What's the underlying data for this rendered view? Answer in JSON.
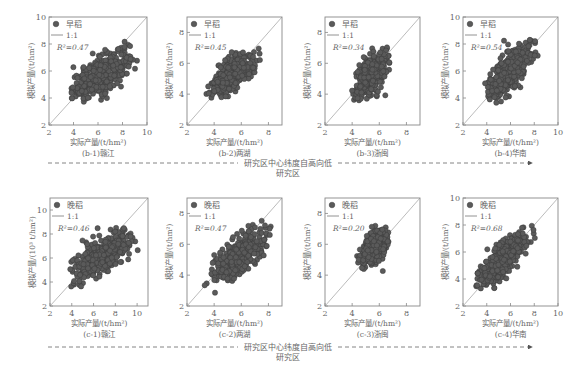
{
  "figure": {
    "arrow_label": "研究区中心纬度自高向低",
    "arrow_sublabel": "研究区",
    "xlabel": "实际产量/(t/hm²)",
    "legend_point": "",
    "legend_line": "1:1",
    "colors": {
      "point": "#5a5a5a",
      "point_edge": "#3a3a3a",
      "frame": "#888888",
      "identity": "#aaaaaa",
      "text": "#666666"
    }
  },
  "chart_data": [
    {
      "id": "b-1",
      "type": "scatter",
      "caption": "(b-1)赣江",
      "series": "早稻",
      "r2": "R²=0.47",
      "xlabel": "实际产量/(t/hm²)",
      "ylabel": "模拟产量/(t/hm²)",
      "xlim": [
        2,
        10
      ],
      "ylim": [
        2,
        10
      ],
      "xticks": [
        2,
        4,
        6,
        8,
        10
      ],
      "yticks": [
        2,
        4,
        6,
        8,
        10
      ],
      "x_range": [
        3.8,
        9.3
      ],
      "y_range": [
        2.9,
        8.8
      ],
      "center": [
        6.2,
        5.7
      ],
      "spread": [
        1.15,
        0.9
      ],
      "corr": 0.69
    },
    {
      "id": "b-2",
      "type": "scatter",
      "caption": "(b-2)两湖",
      "series": "早稻",
      "r2": "R²=0.45",
      "xlabel": "实际产量/(t/hm²)",
      "ylabel": "模拟产量/(t/hm²)",
      "xlim": [
        2,
        9
      ],
      "ylim": [
        2,
        9
      ],
      "xticks": [
        2,
        4,
        6,
        8
      ],
      "yticks": [
        2,
        4,
        6,
        8
      ],
      "x_range": [
        3.3,
        7.5
      ],
      "y_range": [
        3.7,
        7.2
      ],
      "center": [
        5.3,
        5.3
      ],
      "spread": [
        0.75,
        0.65
      ],
      "corr": 0.67
    },
    {
      "id": "b-3",
      "type": "scatter",
      "caption": "(b-3)浙闽",
      "series": "早稻",
      "r2": "R²=0.34",
      "xlabel": "实际产量/(t/hm²)",
      "ylabel": "模拟产量/(t/hm²)",
      "xlim": [
        2,
        9
      ],
      "ylim": [
        2,
        9
      ],
      "xticks": [
        2,
        4,
        6,
        8
      ],
      "yticks": [
        2,
        4,
        6,
        8
      ],
      "x_range": [
        3.9,
        6.8
      ],
      "y_range": [
        3.5,
        7.1
      ],
      "center": [
        5.4,
        5.3
      ],
      "spread": [
        0.6,
        0.75
      ],
      "corr": 0.58
    },
    {
      "id": "b-4",
      "type": "scatter",
      "caption": "(b-4)华南",
      "series": "早稻",
      "r2": "R²=0.54",
      "xlabel": "实际产量/(t/hm²)",
      "ylabel": "模拟产量/(t/hm²)",
      "xlim": [
        2,
        10
      ],
      "ylim": [
        2,
        10
      ],
      "xticks": [
        2,
        4,
        6,
        8,
        10
      ],
      "yticks": [
        2,
        4,
        6,
        8,
        10
      ],
      "x_range": [
        3.8,
        8.3
      ],
      "y_range": [
        3.6,
        8.7
      ],
      "center": [
        5.8,
        5.8
      ],
      "spread": [
        0.95,
        1.05
      ],
      "corr": 0.73
    },
    {
      "id": "c-1",
      "type": "scatter",
      "caption": "(c-1)赣江",
      "series": "晚稻",
      "r2": "R²=0.46",
      "xlabel": "实际产量/(t/hm²)",
      "ylabel": "模拟产量/(10³ t/hm²)",
      "xlim": [
        2,
        11
      ],
      "ylim": [
        2,
        11
      ],
      "xticks": [
        2,
        4,
        6,
        8,
        10
      ],
      "yticks": [
        2,
        4,
        6,
        8,
        10
      ],
      "x_range": [
        3.7,
        10.1
      ],
      "y_range": [
        3.4,
        9.3
      ],
      "center": [
        6.8,
        6.2
      ],
      "spread": [
        1.3,
        1.0
      ],
      "corr": 0.68
    },
    {
      "id": "c-2",
      "type": "scatter",
      "caption": "(c-2)两湖",
      "series": "晚稻",
      "r2": "R²=0.47",
      "xlabel": "实际产量/(t/hm²)",
      "ylabel": "模拟产量/(t/hm²)",
      "xlim": [
        2,
        9
      ],
      "ylim": [
        2,
        9
      ],
      "xticks": [
        2,
        4,
        6,
        8
      ],
      "yticks": [
        2,
        4,
        6,
        8
      ],
      "x_range": [
        3.3,
        8.2
      ],
      "y_range": [
        2.8,
        7.6
      ],
      "center": [
        6.0,
        5.3
      ],
      "spread": [
        1.0,
        0.85
      ],
      "corr": 0.69
    },
    {
      "id": "c-3",
      "type": "scatter",
      "caption": "(c-3)浙闽",
      "series": "晚稻",
      "r2": "R²=0.20",
      "xlabel": "实际产量/(t/hm²)",
      "ylabel": "模拟产量/(t/hm²)",
      "xlim": [
        2,
        9
      ],
      "ylim": [
        2,
        9
      ],
      "xticks": [
        2,
        4,
        6,
        8
      ],
      "yticks": [
        2,
        4,
        6,
        8
      ],
      "x_range": [
        4.3,
        6.7
      ],
      "y_range": [
        4.0,
        7.2
      ],
      "center": [
        5.7,
        5.9
      ],
      "spread": [
        0.5,
        0.55
      ],
      "corr": 0.45
    },
    {
      "id": "c-4",
      "type": "scatter",
      "caption": "(c-4)华南",
      "series": "晚稻",
      "r2": "R²=0.68",
      "xlabel": "实际产量/(t/hm²)",
      "ylabel": "模拟产量/(t/hm²)",
      "xlim": [
        2,
        10
      ],
      "ylim": [
        2,
        10
      ],
      "xticks": [
        2,
        4,
        6,
        8,
        10
      ],
      "yticks": [
        2,
        4,
        6,
        8,
        10
      ],
      "x_range": [
        3.1,
        8.2
      ],
      "y_range": [
        3.2,
        8.1
      ],
      "center": [
        5.4,
        5.4
      ],
      "spread": [
        1.05,
        1.05
      ],
      "corr": 0.82
    }
  ]
}
